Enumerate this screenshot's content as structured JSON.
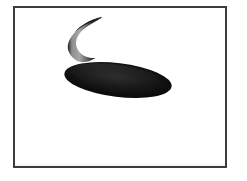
{
  "scene": {
    "title": "Two dark shapes on white background",
    "background_color": "#ffffff",
    "frame": {
      "border_color": "#3c3c3e",
      "border_width_px": 2,
      "x": 13,
      "y": 6,
      "width": 214,
      "height": 162,
      "fill_color": "#ffffff"
    },
    "shapes": [
      {
        "name": "crescent",
        "label": "crescent-moon",
        "description": "Dark crescent opening toward the right, with a gray gradient along its inner left edge",
        "fill_dark": "#141414",
        "fill_mid": "#6e6e6e",
        "fill_light": "#b0b0b0",
        "bbox": {
          "x": 63,
          "y": 14,
          "width": 38,
          "height": 45
        },
        "rotation_deg": 0
      },
      {
        "name": "ellipse",
        "label": "tilted-ellipse",
        "description": "Large solid black ellipse tilted slightly clockwise, positioned below and right of the crescent",
        "fill_dark": "#000000",
        "fill_mid": "#232323",
        "fill_edge": "#0a0a0a",
        "bbox": {
          "x": 65,
          "y": 62,
          "width": 107,
          "height": 36
        },
        "center_x": 118,
        "center_y": 80,
        "radius_x": 54,
        "radius_y": 17,
        "rotation_deg": 7
      }
    ]
  }
}
